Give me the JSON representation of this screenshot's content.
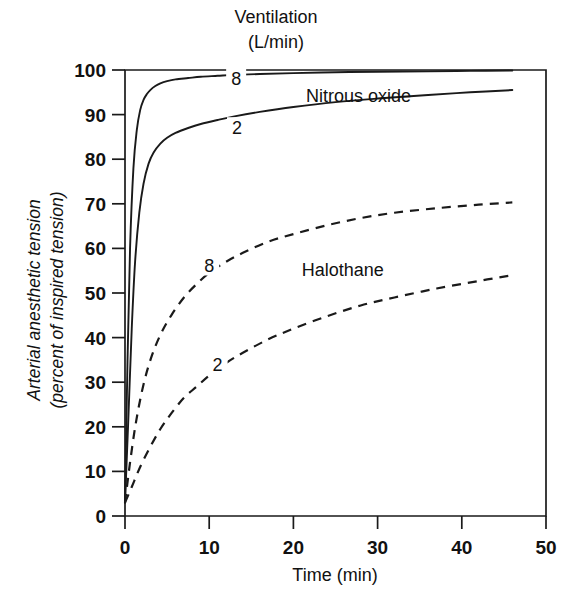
{
  "figure": {
    "title": "Ventilation",
    "subtitle": "(L/min)"
  },
  "chart_data": {
    "type": "line",
    "title": "Ventilation (L/min)",
    "xlabel": "Time (min)",
    "ylabel": "Arterial anesthetic tension (percent of inspired tension)",
    "ylabel_line1": "Arterial anesthetic tension",
    "ylabel_line2": "(percent of inspired tension)",
    "xlim": [
      0,
      50
    ],
    "ylim": [
      0,
      100
    ],
    "xticks": [
      0,
      10,
      20,
      30,
      40,
      50
    ],
    "xticklabels": [
      "0",
      "10",
      "20",
      "30",
      "40",
      "50"
    ],
    "yticks": [
      0,
      10,
      20,
      30,
      40,
      50,
      60,
      70,
      80,
      90,
      100
    ],
    "yticklabels": [
      "0",
      "10",
      "20",
      "30",
      "40",
      "50",
      "60",
      "70",
      "80",
      "90",
      "100"
    ],
    "grid": false,
    "legend_position": "inline-annotations",
    "group_annotations": [
      {
        "text": "Nitrous oxide",
        "x": 21.5,
        "y": 94.0
      },
      {
        "text": "Halothane",
        "x": 21.0,
        "y": 55.0
      }
    ],
    "series": [
      {
        "name": "Nitrous oxide, ventilation 8 L/min",
        "agent": "Nitrous oxide",
        "ventilation": "8",
        "label": "8",
        "linestyle": "solid",
        "label_x": 13.2,
        "label_y": 97.5,
        "x": [
          0,
          0.3,
          0.6,
          1.0,
          1.4,
          1.8,
          2.2,
          2.6,
          3.0,
          3.6,
          4.2,
          5.0,
          6.0,
          7.5,
          9.0,
          11.0,
          13.0,
          16.0,
          20.0,
          25.0,
          30.0,
          36.0,
          41.0,
          46.0
        ],
        "y": [
          3.0,
          35.0,
          60.0,
          78.0,
          86.5,
          91.0,
          93.3,
          94.6,
          95.5,
          96.4,
          97.0,
          97.5,
          97.9,
          98.2,
          98.5,
          98.7,
          98.9,
          99.1,
          99.3,
          99.5,
          99.6,
          99.7,
          99.8,
          99.9
        ]
      },
      {
        "name": "Nitrous oxide, ventilation 2 L/min",
        "agent": "Nitrous oxide",
        "ventilation": "2",
        "label": "2",
        "linestyle": "solid",
        "label_x": 13.3,
        "label_y": 86.5,
        "x": [
          0,
          0.4,
          0.8,
          1.2,
          1.7,
          2.2,
          2.8,
          3.4,
          4.2,
          5.0,
          6.0,
          7.5,
          9.0,
          11.0,
          13.0,
          16.0,
          20.0,
          25.0,
          30.0,
          36.0,
          41.0,
          46.0
        ],
        "y": [
          3.0,
          22.0,
          42.0,
          57.0,
          68.0,
          74.5,
          79.0,
          81.5,
          83.5,
          84.8,
          85.9,
          87.0,
          87.9,
          88.8,
          89.6,
          90.6,
          91.7,
          92.8,
          93.6,
          94.4,
          95.0,
          95.5
        ]
      },
      {
        "name": "Halothane, ventilation 8 L/min",
        "agent": "Halothane",
        "ventilation": "8",
        "label": "8",
        "linestyle": "dashed",
        "label_x": 10.0,
        "label_y": 55.5,
        "x": [
          0,
          0.6,
          1.3,
          2.2,
          3.2,
          4.3,
          5.5,
          7.0,
          8.5,
          10.0,
          12.0,
          14.0,
          17.0,
          20.0,
          24.0,
          28.0,
          32.0,
          37.0,
          42.0,
          46.0
        ],
        "y": [
          3.0,
          12.0,
          21.0,
          29.5,
          36.0,
          41.0,
          45.0,
          49.0,
          52.0,
          54.5,
          57.0,
          59.0,
          61.5,
          63.2,
          65.2,
          66.8,
          68.0,
          69.0,
          69.8,
          70.3
        ]
      },
      {
        "name": "Halothane, ventilation 2 L/min",
        "agent": "Halothane",
        "ventilation": "2",
        "label": "2",
        "linestyle": "dashed",
        "label_x": 11.0,
        "label_y": 33.5,
        "x": [
          0,
          0.8,
          1.8,
          3.0,
          4.2,
          5.5,
          7.0,
          8.5,
          10.0,
          12.0,
          14.0,
          17.0,
          20.0,
          24.0,
          28.0,
          32.0,
          37.0,
          42.0,
          46.0
        ],
        "y": [
          3.0,
          6.5,
          11.0,
          15.5,
          19.5,
          23.0,
          26.5,
          29.0,
          31.5,
          34.3,
          36.6,
          39.6,
          42.0,
          44.8,
          47.2,
          49.0,
          51.0,
          52.7,
          54.0
        ]
      }
    ]
  },
  "colors": {
    "ink": "#1a1a1a",
    "background": "#ffffff"
  }
}
